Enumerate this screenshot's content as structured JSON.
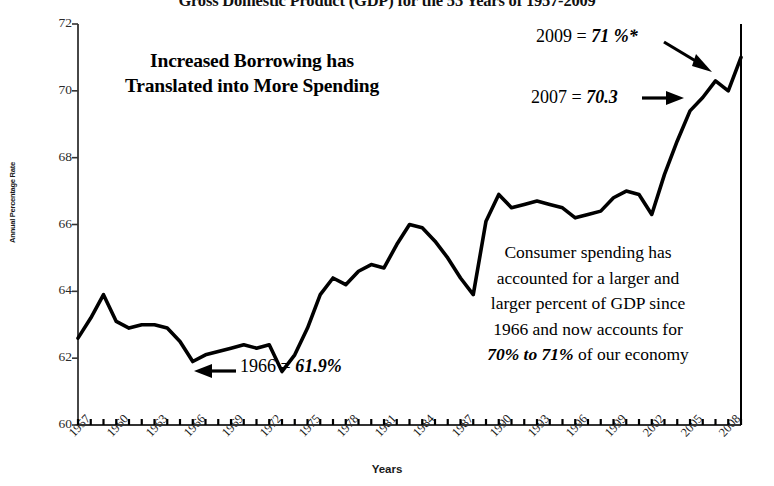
{
  "chart_data": {
    "type": "line",
    "title": "Gross Domestic Product (GDP) for the 53 Years of 1957-2009",
    "xlabel": "Years",
    "ylabel": "Annual Percentage Rate",
    "ylim": [
      60,
      72
    ],
    "xlim": [
      1957,
      2009
    ],
    "ytick_labels": [
      "72",
      "70",
      "68",
      "66",
      "64",
      "62",
      "60"
    ],
    "ytick_values": [
      72,
      70,
      68,
      66,
      64,
      62,
      60
    ],
    "xtick_labels": [
      "1957",
      "1960",
      "1963",
      "1966",
      "1969",
      "1972",
      "1975",
      "1978",
      "1981",
      "1984",
      "1987",
      "1990",
      "1993",
      "1996",
      "1999",
      "2002",
      "2005",
      "2008"
    ],
    "xtick_values": [
      1957,
      1960,
      1963,
      1966,
      1969,
      1972,
      1975,
      1978,
      1981,
      1984,
      1987,
      1990,
      1993,
      1996,
      1999,
      2002,
      2005,
      2008
    ],
    "grid": false,
    "legend": "none",
    "series_name": "Consumer spending as percent of GDP",
    "x": [
      1957,
      1958,
      1959,
      1960,
      1961,
      1962,
      1963,
      1964,
      1965,
      1966,
      1967,
      1968,
      1969,
      1970,
      1971,
      1972,
      1973,
      1974,
      1975,
      1976,
      1977,
      1978,
      1979,
      1980,
      1981,
      1982,
      1983,
      1984,
      1985,
      1986,
      1987,
      1988,
      1989,
      1990,
      1991,
      1992,
      1993,
      1994,
      1995,
      1996,
      1997,
      1998,
      1999,
      2000,
      2001,
      2002,
      2003,
      2004,
      2005,
      2006,
      2007,
      2008,
      2009
    ],
    "values": [
      62.6,
      63.2,
      63.9,
      63.1,
      62.9,
      63.0,
      63.0,
      62.9,
      62.5,
      61.9,
      62.1,
      62.2,
      62.3,
      62.4,
      62.3,
      62.4,
      61.6,
      62.1,
      62.9,
      63.9,
      64.4,
      64.2,
      64.6,
      64.8,
      64.7,
      65.4,
      66.0,
      65.9,
      65.5,
      65.0,
      64.4,
      63.9,
      66.1,
      66.9,
      66.5,
      66.6,
      66.7,
      66.6,
      66.5,
      66.2,
      66.3,
      66.4,
      66.8,
      67.0,
      66.9,
      66.3,
      67.5,
      68.5,
      69.4,
      69.8,
      70.3,
      70.0,
      71.0
    ],
    "annotations": {
      "headline": "Increased Borrowing has Translated into More Spending",
      "point_2009_label": "2009 = ",
      "point_2009_value": "71 %*",
      "point_2007_label": "2007 = ",
      "point_2007_value": "70.3",
      "point_1966_label": "1966 = ",
      "point_1966_value": "61.9%",
      "paragraph_line1": "Consumer spending has",
      "paragraph_line2": "accounted for a larger and",
      "paragraph_line3": "larger percent of GDP since",
      "paragraph_line4": "1966 and now accounts for",
      "paragraph_line5_bold": "70% to 71%",
      "paragraph_line5_rest": " of our economy"
    },
    "colors": {
      "line": "#000000",
      "axis": "#333333",
      "background": "#ffffff",
      "text": "#000000"
    }
  }
}
